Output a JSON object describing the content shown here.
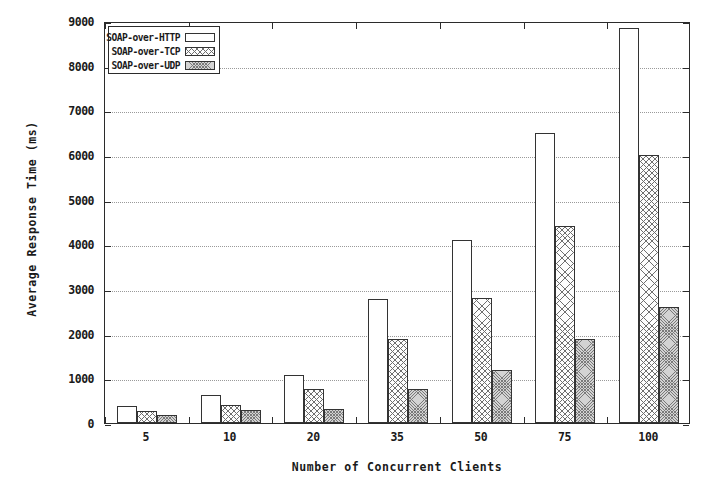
{
  "chart_data": {
    "type": "bar",
    "title": "",
    "xlabel": "Number of Concurrent Clients",
    "ylabel": "Average Response Time (ms)",
    "categories": [
      "5",
      "10",
      "20",
      "35",
      "50",
      "75",
      "100"
    ],
    "ylim": [
      0,
      9000
    ],
    "yticks": [
      0,
      1000,
      2000,
      3000,
      4000,
      5000,
      6000,
      7000,
      8000,
      9000
    ],
    "ytick_labels": [
      "0",
      "1000",
      "2000",
      "3000",
      "4000",
      "5000",
      "6000",
      "7000",
      "8000",
      "9000"
    ],
    "grid": true,
    "legend_position": "top-left",
    "series": [
      {
        "name": "SOAP-over-HTTP",
        "fill": "white",
        "values": [
          380,
          630,
          1080,
          2780,
          4100,
          6500,
          8850
        ]
      },
      {
        "name": "SOAP-over-TCP",
        "fill": "cross-hatch",
        "values": [
          280,
          400,
          760,
          1880,
          2790,
          4400,
          6000
        ]
      },
      {
        "name": "SOAP-over-UDP",
        "fill": "dense-stipple",
        "values": [
          180,
          300,
          320,
          770,
          1180,
          1880,
          2600
        ]
      }
    ]
  },
  "colors": {
    "axis": "#2b2b2b",
    "grid": "#9a9a9a",
    "bar_outline": "#333333",
    "http_fill": "#ffffff",
    "tcp_fill": "#fdfdfd",
    "udp_fill": "#d3d3d3",
    "background": "#ffffff"
  }
}
